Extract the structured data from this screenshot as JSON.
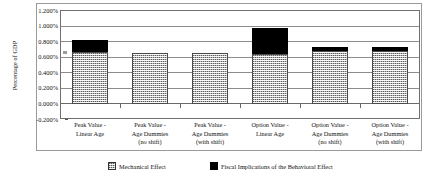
{
  "chart_data": {
    "type": "bar",
    "title": "",
    "xlabel": "",
    "ylabel": "Percentage of GDP",
    "ylim": [
      -0.002,
      0.012
    ],
    "ytick_labels": [
      "1.200%",
      "1.000%",
      "0.800%",
      "0.600%",
      "0.400%",
      "0.200%",
      "0.000%",
      "-0.200%"
    ],
    "ytick_values": [
      1.2,
      1.0,
      0.8,
      0.6,
      0.4,
      0.2,
      0.0,
      -0.2
    ],
    "grid": true,
    "stacked": true,
    "legend_position": "bottom",
    "value_unit": "percent of GDP",
    "categories": [
      "Peak Value - Linear Age",
      "Peak Value - Age Dummies (no shift)",
      "Peak Value - Age Dummies (with shift)",
      "Option Value - Linear Age",
      "Option Value - Age Dummies (no shift)",
      "Option Value - Age Dummies (with shift)"
    ],
    "category_lines": [
      [
        "Peak Value -",
        "Linear Age"
      ],
      [
        "Peak Value -",
        "Age Dummies",
        "(no shift)"
      ],
      [
        "Peak Value -",
        "Age Dummies",
        "(with shift)"
      ],
      [
        "Option Value -",
        "Linear Age"
      ],
      [
        "Option Value -",
        "Age Dummies",
        "(no shift)"
      ],
      [
        "Option Value -",
        "Age Dummies",
        "(with shift)"
      ]
    ],
    "series": [
      {
        "name": "Mechanical Effect",
        "pattern": "hatched",
        "color": "#b8b8b8",
        "values": [
          0.665,
          0.655,
          0.655,
          0.645,
          0.68,
          0.68
        ]
      },
      {
        "name": "Fiscal Implications of the Behavioral Effect",
        "pattern": "solid",
        "color": "#000000",
        "values": [
          0.16,
          0.0,
          0.0,
          0.335,
          0.05,
          0.05
        ]
      }
    ],
    "totals": [
      0.825,
      0.655,
      0.655,
      0.98,
      0.73,
      0.73
    ]
  },
  "legend": {
    "items": [
      {
        "label": "Mechanical Effect"
      },
      {
        "label": "Fiscal Implications of the Behavioral Effect"
      }
    ]
  }
}
